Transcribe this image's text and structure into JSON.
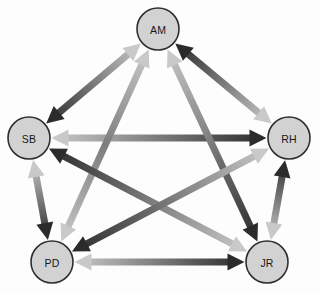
{
  "diagram": {
    "type": "sociogram",
    "layout": "pentagon",
    "canvas": {
      "width": 320,
      "height": 293
    },
    "background_color": "#fdfdfd",
    "node_style": {
      "fill": "#d2d2d2",
      "stroke": "#2e2e2e",
      "radius": 21,
      "label_color": "#171717"
    },
    "arrow_style": {
      "dark_color": "#2b2b2b",
      "light_color": "#c9c9c9",
      "mid_color": "#7d7d7d",
      "shaft_width": 7,
      "head_width": 17,
      "head_length": 17
    },
    "nodes": [
      {
        "id": "AM",
        "label": "AM",
        "x": 158,
        "y": 29
      },
      {
        "id": "SB",
        "label": "SB",
        "x": 29,
        "y": 138
      },
      {
        "id": "RH",
        "label": "RH",
        "x": 289,
        "y": 138
      },
      {
        "id": "PD",
        "label": "PD",
        "x": 52,
        "y": 262
      },
      {
        "id": "JR",
        "label": "JR",
        "x": 267,
        "y": 262
      }
    ],
    "edges": [
      {
        "id": "edge-sb-am",
        "from": "SB",
        "to": "AM",
        "from_head": "dark",
        "to_head": "light",
        "bidirectional": true
      },
      {
        "id": "edge-am-rh",
        "from": "AM",
        "to": "RH",
        "from_head": "dark",
        "to_head": "light",
        "bidirectional": true
      },
      {
        "id": "edge-sb-rh",
        "from": "SB",
        "to": "RH",
        "from_head": "light",
        "to_head": "dark",
        "bidirectional": true
      },
      {
        "id": "edge-sb-pd",
        "from": "SB",
        "to": "PD",
        "from_head": "light",
        "to_head": "dark",
        "bidirectional": true
      },
      {
        "id": "edge-rh-jr",
        "from": "RH",
        "to": "JR",
        "from_head": "dark",
        "to_head": "light",
        "bidirectional": true
      },
      {
        "id": "edge-pd-jr",
        "from": "PD",
        "to": "JR",
        "from_head": "light",
        "to_head": "dark",
        "bidirectional": true
      },
      {
        "id": "edge-am-pd",
        "from": "AM",
        "to": "PD",
        "from_head": "light",
        "to_head": "light",
        "bidirectional": true
      },
      {
        "id": "edge-am-jr",
        "from": "AM",
        "to": "JR",
        "from_head": "light",
        "to_head": "dark",
        "bidirectional": true
      },
      {
        "id": "edge-sb-jr",
        "from": "SB",
        "to": "JR",
        "from_head": "dark",
        "to_head": "light",
        "bidirectional": true
      },
      {
        "id": "edge-pd-rh",
        "from": "PD",
        "to": "RH",
        "from_head": "dark",
        "to_head": "light",
        "bidirectional": true
      }
    ]
  }
}
